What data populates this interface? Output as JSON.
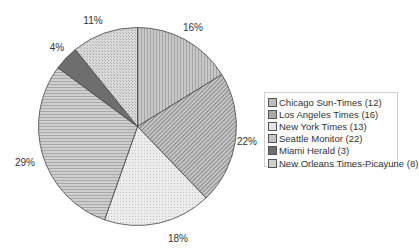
{
  "chart_data": {
    "type": "pie",
    "title": "",
    "start_angle_deg": 0,
    "direction": "clockwise",
    "categories": [
      "Chicago Sun-Times",
      "Los Angeles Times",
      "New York Times",
      "Seattle Monitor",
      "Miami Herald",
      "New Orleans Times-Picayune"
    ],
    "values": [
      12,
      16,
      13,
      22,
      3,
      8
    ],
    "percent_labels": [
      "16%",
      "22%",
      "18%",
      "29%",
      "4%",
      "11%"
    ],
    "legend_entries": [
      "Chicago Sun-Times (12)",
      "Los Angeles Times (16)",
      "New York Times (13)",
      "Seattle Monitor (22)",
      "Miami Herald (3)",
      "New Orleans Times-Picayune (8)"
    ],
    "fills": [
      "#bdbdbd",
      "#a9a9a9",
      "#e4e4e4",
      "#c4c4c4",
      "#6e6e6e",
      "#cfcfcf"
    ],
    "patterns": [
      "vertical",
      "diagonal",
      "dots",
      "horizontal",
      "solid",
      "crosshatch"
    ],
    "legend_position": "right"
  },
  "layout": {
    "cx": 137.5,
    "cy": 126.5,
    "r": 99,
    "label_positions": [
      [
        193,
        27
      ],
      [
        247,
        141
      ],
      [
        178,
        238
      ],
      [
        25,
        162
      ],
      [
        57,
        47
      ],
      [
        93,
        20
      ]
    ]
  }
}
